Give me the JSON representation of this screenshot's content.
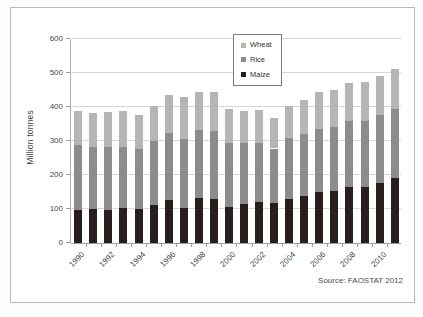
{
  "frame": {
    "source_note": "Source: FAOSTAT 2012"
  },
  "colors": {
    "wheat": "#b5b5b5",
    "rice": "#8c8c8c",
    "maize": "#281e1e",
    "grid": "#d6d6d6",
    "axis": "#9e9e9e",
    "text": "#4a4a4a",
    "legend_border": "#7a7a7a"
  },
  "chart_data": {
    "type": "bar",
    "stacked": true,
    "title": "",
    "xlabel": "",
    "ylabel": "Million tonnes",
    "ylim": [
      0,
      600
    ],
    "yticks": [
      0,
      100,
      200,
      300,
      400,
      500,
      600
    ],
    "grid": true,
    "legend_position": "top-center-inside",
    "legend_order": [
      "Wheat",
      "Rice",
      "Maize"
    ],
    "categories": [
      "1990",
      "1991",
      "1992",
      "1993",
      "1994",
      "1995",
      "1996",
      "1997",
      "1998",
      "1999",
      "2000",
      "2001",
      "2002",
      "2003",
      "2004",
      "2005",
      "2006",
      "2007",
      "2008",
      "2009",
      "2010",
      "2011"
    ],
    "xtick_labels": [
      "1990",
      "1992",
      "1994",
      "1996",
      "1998",
      "2000",
      "2002",
      "2004",
      "2006",
      "2008",
      "2010"
    ],
    "series": [
      {
        "name": "Maize",
        "color_key": "maize",
        "values": [
          97,
          101,
          96,
          104,
          100,
          112,
          126,
          104,
          131,
          128,
          107,
          114,
          120,
          117,
          128,
          139,
          150,
          152,
          166,
          164,
          176,
          190
        ]
      },
      {
        "name": "Rice",
        "color_key": "rice",
        "values": [
          191,
          182,
          187,
          177,
          177,
          188,
          199,
          203,
          202,
          200,
          186,
          179,
          175,
          161,
          182,
          181,
          185,
          189,
          192,
          195,
          201,
          204
        ]
      },
      {
        "name": "Wheat",
        "color_key": "wheat",
        "values": [
          100,
          98,
          102,
          108,
          100,
          103,
          109,
          122,
          111,
          115,
          101,
          95,
          95,
          89,
          93,
          100,
          108,
          109,
          113,
          116,
          113,
          119
        ]
      }
    ]
  }
}
